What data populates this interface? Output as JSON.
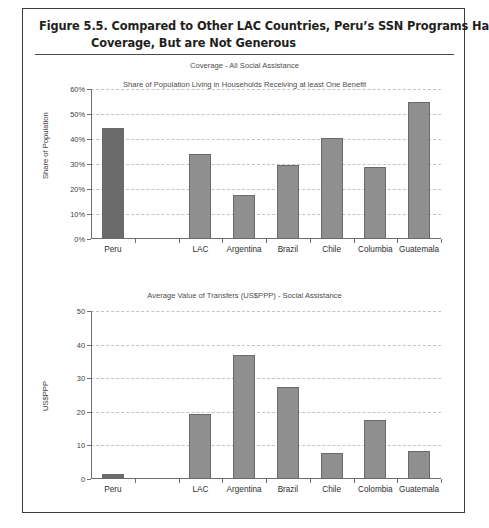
{
  "figure": {
    "caption_line_1": "Figure 5.5.  Compared to Other LAC Countries, Peru’s SSN Programs Have High",
    "caption_line_2": "Coverage, But are Not Generous",
    "border_color": "#3b3b3b",
    "highlight_bar_color": "#6b6b6b",
    "bar_color": "#8f8f8f"
  },
  "chart_data": [
    {
      "type": "bar",
      "title": "Coverage - All Social Assistance",
      "subtitle": "Share of Population Living in Households Receiving at least One Benefit",
      "xlabel": "",
      "ylabel": "Share of Population",
      "ylim": [
        0,
        60
      ],
      "ytick_labels": [
        "0%",
        "10%",
        "20%",
        "30%",
        "40%",
        "50%",
        "60%"
      ],
      "ytick_values": [
        0,
        10,
        20,
        30,
        40,
        50,
        60
      ],
      "grid": true,
      "legend": "none",
      "categories": [
        "Peru",
        "",
        "LAC",
        "Argentina",
        "Brazil",
        "Chile",
        "Columbia",
        "Guatemala"
      ],
      "values": [
        44.5,
        null,
        34.0,
        17.8,
        29.7,
        40.6,
        28.7,
        54.8
      ],
      "highlight_index": 0
    },
    {
      "type": "bar",
      "title": "Average Value of Transfers (US$PPP) - Social Assistance",
      "subtitle": "",
      "xlabel": "",
      "ylabel": "US$PPP",
      "ylim": [
        0,
        50
      ],
      "ytick_labels": [
        "0",
        "10",
        "20",
        "30",
        "40",
        "50"
      ],
      "ytick_values": [
        0,
        10,
        20,
        30,
        40,
        50
      ],
      "grid": true,
      "legend": "none",
      "categories": [
        "Peru",
        "",
        "LAC",
        "Argentina",
        "Brazil",
        "Chile",
        "Colombia",
        "Guatemala"
      ],
      "values": [
        1.6,
        null,
        19.4,
        37.0,
        27.5,
        7.8,
        17.7,
        8.3
      ],
      "highlight_index": 0
    }
  ]
}
